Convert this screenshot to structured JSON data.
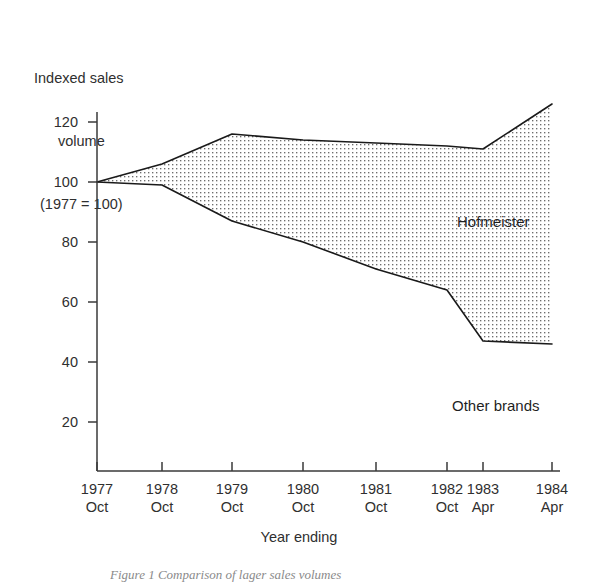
{
  "chart_data": {
    "type": "area",
    "title": "",
    "ylabel": "Indexed sales volume (1977 = 100)",
    "ylabel_lines": [
      "Indexed sales",
      "volume",
      "(1977 = 100)"
    ],
    "xlabel": "Year ending",
    "categories": [
      "1977 Oct",
      "1978 Oct",
      "1979 Oct",
      "1980 Oct",
      "1981 Oct",
      "1982 Oct",
      "1983 Apr",
      "1984 Apr"
    ],
    "x_tick_years": [
      "1977",
      "1978",
      "1979",
      "1980",
      "1981",
      "1982",
      "1983",
      "1984"
    ],
    "x_tick_months": [
      "Oct",
      "Oct",
      "Oct",
      "Oct",
      "Oct",
      "Oct",
      "Apr",
      "Apr"
    ],
    "x_positions_px": [
      97,
      162,
      232,
      303,
      376,
      447,
      483,
      552
    ],
    "ylim": [
      0,
      130
    ],
    "y_ticks": [
      20,
      40,
      60,
      80,
      100,
      120
    ],
    "y_tick_labels": [
      "20",
      "40",
      "60",
      "80",
      "100",
      "120"
    ],
    "grid": false,
    "legend_position": "in-plot-annotations",
    "series": [
      {
        "name": "Total (upper boundary)",
        "values": [
          100,
          106,
          116,
          114,
          113,
          112,
          111,
          126
        ]
      },
      {
        "name": "Other brands",
        "values": [
          100,
          99,
          87,
          80,
          71,
          64,
          47,
          46
        ]
      }
    ],
    "band_fill": {
      "name": "Hofmeister",
      "description": "Stippled band between the two curves",
      "values": [
        0,
        7,
        29,
        34,
        42,
        48,
        64,
        80
      ]
    },
    "annotations": [
      {
        "text": "Hofmeister",
        "x": "1983 Apr",
        "y": 95
      },
      {
        "text": "Other brands",
        "x": "1983 Apr",
        "y": 25
      }
    ]
  },
  "axis": {
    "y_title_line_1": "Indexed sales",
    "y_title_line_2": "volume",
    "y_title_line_3": "(1977 = 100)",
    "x_title": "Year ending"
  },
  "labels": {
    "hofmeister": "Hofmeister",
    "other_brands": "Other brands"
  },
  "caption": {
    "text": "Figure 1 Comparison of lager sales volumes"
  },
  "colors": {
    "line": "#1a1a1a",
    "axis": "#3a3a3a",
    "stipple": "#6d6d6d",
    "text": "#2f2f2f",
    "background": "#ffffff",
    "caption": "#8a8a8a"
  }
}
